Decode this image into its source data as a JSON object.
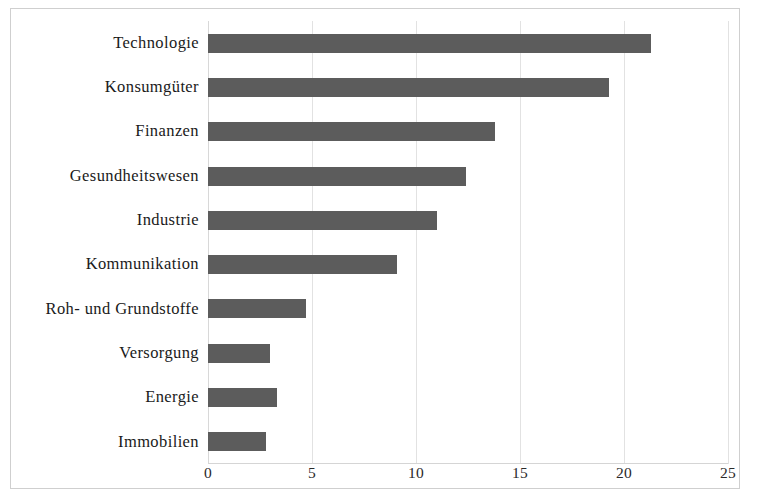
{
  "chart_data": {
    "type": "bar",
    "orientation": "horizontal",
    "title": "",
    "subtitle": "",
    "xlabel": "",
    "ylabel": "",
    "xlim": [
      0,
      25
    ],
    "xticks": [
      0,
      5,
      10,
      15,
      20,
      25
    ],
    "xtick_labels": [
      "0",
      "5",
      "10",
      "15",
      "20",
      "25"
    ],
    "grid": true,
    "legend": false,
    "bar_color": "#5c5c5c",
    "grid_color": "#e2e2e2",
    "frame_color": "#cfcfcf",
    "categories": [
      "Technologie",
      "Konsumgüter",
      "Finanzen",
      "Gesundheitswesen",
      "Industrie",
      "Kommunikation",
      "Roh- und Grundstoffe",
      "Versorgung",
      "Energie",
      "Immobilien"
    ],
    "values": [
      21.3,
      19.3,
      13.8,
      12.4,
      11.0,
      9.1,
      4.7,
      3.0,
      3.3,
      2.8
    ]
  }
}
